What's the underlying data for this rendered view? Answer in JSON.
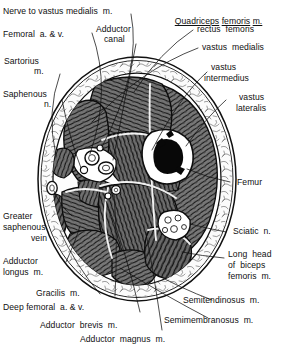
{
  "figure": {
    "type": "anatomical-cross-section",
    "region": "mid-thigh transverse section",
    "view": "transverse"
  },
  "headings": {
    "quadriceps_group": "Quadriceps  femoris  m.",
    "quadriceps_parts": [
      "Quadriceps",
      "femoris",
      "m."
    ]
  },
  "labels": {
    "nerve_vastus_medialis": "Nerve to vastus medialis  m.",
    "femoral_vessels": "Femoral  a. & v.",
    "sartorius": "Sartorius\n    m.",
    "sartorius_l1": "Sartorius",
    "sartorius_l2": "m.",
    "saphenous_nerve_l1": "Saphenous",
    "saphenous_nerve_l2": "n.",
    "adductor_canal_l1": "Adductor",
    "adductor_canal_l2": "canal",
    "rectus_femoris": "rectus  femoris",
    "vastus_medialis": "vastus  medialis",
    "vastus_intermedius_l1": "vastus",
    "vastus_intermedius_l2": "intermedius",
    "vastus_lateralis_l1": "vastus",
    "vastus_lateralis_l2": "lateralis",
    "femur": "Femur",
    "sciatic_nerve": "Sciatic  n.",
    "long_head_biceps_l1": "Long  head",
    "long_head_biceps_l2": "of  biceps",
    "long_head_biceps_l3": "femoris  m.",
    "semitendinosus": "Semitendinosus  m.",
    "semimembranosus": "Semimembranosus  m.",
    "adductor_magnus": "Adductor  magnus  m.",
    "adductor_brevis": "Adductor  brevis  m.",
    "deep_femoral_vessels": "Deep femoral  a. & v.",
    "gracilis": "Gracilis  m.",
    "adductor_longus_l1": "Adductor",
    "adductor_longus_l2": "longus  m.",
    "greater_saphenous_l1": "Greater",
    "greater_saphenous_l2": "saphenous",
    "greater_saphenous_l3": "vein"
  },
  "structures": [
    {
      "name": "femur",
      "appearance": "white cortical ring with dark marrow cavity"
    },
    {
      "name": "subcutaneous-fat",
      "appearance": "stippled reticular rim"
    },
    {
      "name": "muscle-compartments",
      "appearance": "dark hatched fascicles"
    },
    {
      "name": "adductor-canal",
      "appearance": "vessel cluster left of femur"
    },
    {
      "name": "sciatic-nerve",
      "appearance": "fascicular bundle posterolateral"
    }
  ],
  "colors": {
    "ink": "#101010",
    "muscle_fill": "#6d6d6d",
    "muscle_dark": "#2a2a2a",
    "fat_fill": "#f4f4f4",
    "bone_white": "#ffffff",
    "marrow": "#080808",
    "background": "#ffffff"
  }
}
